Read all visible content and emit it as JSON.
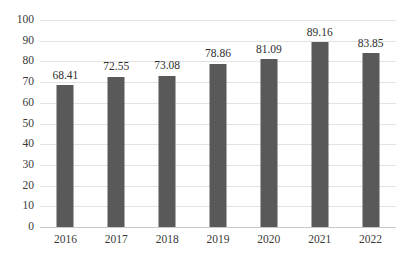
{
  "chart_data": {
    "type": "bar",
    "title": "",
    "subtitle": "",
    "xlabel": "",
    "ylabel": "",
    "categories": [
      "2016",
      "2017",
      "2018",
      "2019",
      "2020",
      "2021",
      "2022"
    ],
    "values": [
      68.41,
      72.55,
      73.08,
      78.86,
      81.09,
      89.16,
      83.85
    ],
    "value_labels": [
      "68.41",
      "72.55",
      "73.08",
      "78.86",
      "81.09",
      "89.16",
      "83.85"
    ],
    "ylim": [
      0,
      100
    ],
    "ytick_step": 10,
    "ytick_labels": [
      "100",
      "90",
      "80",
      "70",
      "60",
      "50",
      "40",
      "30",
      "20",
      "10",
      "0"
    ],
    "ytick_values": [
      100,
      90,
      80,
      70,
      60,
      50,
      40,
      30,
      20,
      10,
      0
    ],
    "grid": true,
    "legend": false,
    "legend_position": "none",
    "series": [
      {
        "name": "",
        "values": [
          68.41,
          72.55,
          73.08,
          78.86,
          81.09,
          89.16,
          83.85
        ]
      }
    ],
    "colors": {
      "bar_fill": "#595959",
      "gridline": "#e2e2e2",
      "baseline": "#c9c9c9",
      "background": "#ffffff",
      "tick_text": "#3a3a3a",
      "value_text": "#2f2f2f"
    }
  }
}
